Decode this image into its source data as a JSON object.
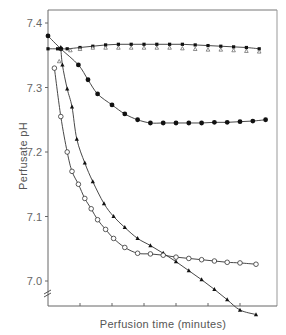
{
  "chart_data": {
    "type": "line",
    "title": "",
    "xlabel": "Perfusion time (minutes)",
    "ylabel": "Perfusate pH",
    "x_tick_labels": [],
    "x_ticks_count": 6,
    "y_ticks": [
      7.0,
      7.1,
      7.2,
      7.3,
      7.4
    ],
    "y_tick_labels": [
      "7.0",
      "7.1",
      "7.2",
      "7.3",
      "7.4"
    ],
    "ylim": [
      6.96,
      7.42
    ],
    "xlim": [
      0,
      7.2
    ],
    "y_axis_break": true,
    "grid": false,
    "legend": "none",
    "x_units_note": "x expressed in tick-interval units (no numeric x labels shown)",
    "series": [
      {
        "name": "filled squares (control, stable)",
        "marker": "filled-square",
        "x": [
          0,
          0.3,
          0.6,
          1.0,
          1.4,
          1.8,
          2.2,
          2.6,
          3.0,
          3.4,
          3.8,
          4.2,
          4.6,
          5.0,
          5.4,
          5.8,
          6.2,
          6.6
        ],
        "values": [
          7.36,
          7.36,
          7.36,
          7.362,
          7.364,
          7.366,
          7.367,
          7.367,
          7.367,
          7.367,
          7.367,
          7.367,
          7.366,
          7.365,
          7.364,
          7.363,
          7.362,
          7.36
        ]
      },
      {
        "name": "open triangles (control, stable)",
        "marker": "open-triangle",
        "x": [
          0.35,
          0.7,
          1.0,
          1.4,
          1.8,
          2.2,
          2.6,
          3.0,
          3.4,
          3.8,
          4.2,
          4.6,
          5.0,
          5.4,
          5.8,
          6.2,
          6.6
        ],
        "values": [
          7.345,
          7.362,
          7.364,
          7.366,
          7.366,
          7.366,
          7.366,
          7.366,
          7.366,
          7.366,
          7.365,
          7.364,
          7.363,
          7.363,
          7.362,
          7.361,
          7.36
        ]
      },
      {
        "name": "filled circles",
        "marker": "filled-circle",
        "x": [
          0,
          0.4,
          0.95,
          1.25,
          1.55,
          2.0,
          2.4,
          2.8,
          3.2,
          3.6,
          4.0,
          4.4,
          4.8,
          5.2,
          5.6,
          6.0,
          6.4,
          6.8
        ],
        "values": [
          7.38,
          7.36,
          7.335,
          7.312,
          7.29,
          7.273,
          7.259,
          7.25,
          7.245,
          7.245,
          7.245,
          7.245,
          7.245,
          7.246,
          7.246,
          7.247,
          7.248,
          7.25
        ]
      },
      {
        "name": "filled triangles",
        "marker": "filled-triangle",
        "x": [
          0.4,
          0.45,
          0.6,
          0.75,
          0.9,
          1.15,
          1.4,
          1.75,
          2.05,
          2.4,
          2.8,
          3.2,
          3.6,
          4.0,
          4.4,
          4.8,
          5.2,
          5.6,
          6.0,
          6.5
        ],
        "values": [
          7.362,
          7.335,
          7.298,
          7.27,
          7.22,
          7.183,
          7.154,
          7.12,
          7.1,
          7.083,
          7.066,
          7.055,
          7.043,
          7.03,
          7.016,
          7.002,
          6.987,
          6.971,
          6.955,
          6.948
        ]
      },
      {
        "name": "open circles",
        "marker": "open-circle",
        "x": [
          0.2,
          0.4,
          0.6,
          0.75,
          0.95,
          1.15,
          1.35,
          1.55,
          1.8,
          2.05,
          2.4,
          2.8,
          3.2,
          3.6,
          4.0,
          4.4,
          4.8,
          5.2,
          5.6,
          6.0,
          6.5
        ],
        "values": [
          7.33,
          7.255,
          7.2,
          7.17,
          7.15,
          7.128,
          7.112,
          7.095,
          7.08,
          7.066,
          7.052,
          7.043,
          7.042,
          7.04,
          7.037,
          7.035,
          7.033,
          7.031,
          7.029,
          7.028,
          7.026
        ]
      }
    ]
  }
}
